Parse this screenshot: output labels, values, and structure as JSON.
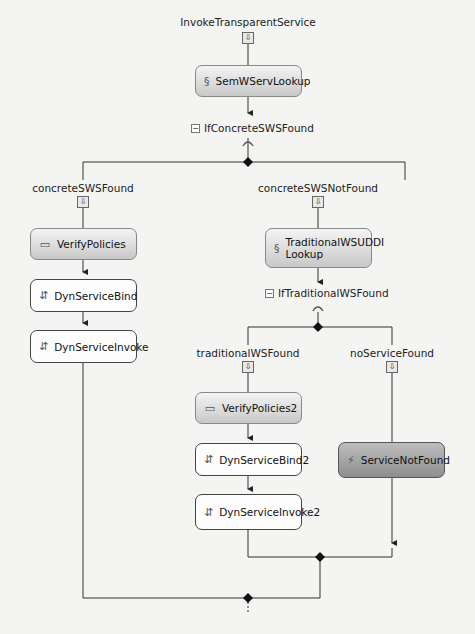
{
  "workflow": {
    "root_label": "InvokeTransparentService",
    "nodes": {
      "semwserv": {
        "label": "SemWServLookup",
        "icon": "script-icon"
      },
      "verify1": {
        "label": "VerifyPolicies",
        "icon": "policy-icon"
      },
      "bind1": {
        "label": "DynServiceBind",
        "icon": "invoke-icon"
      },
      "invoke1": {
        "label": "DynServiceInvoke",
        "icon": "invoke-icon"
      },
      "uddi": {
        "label_line1": "TraditionalWSUDDI",
        "label_line2": "Lookup",
        "icon": "script-icon"
      },
      "verify2": {
        "label": "VerifyPolicies2",
        "icon": "policy-icon"
      },
      "bind2": {
        "label": "DynServiceBind2",
        "icon": "invoke-icon"
      },
      "invoke2": {
        "label": "DynServiceInvoke2",
        "icon": "invoke-icon"
      },
      "notfound": {
        "label": "ServiceNotFound",
        "icon": "throw-icon"
      }
    },
    "conditions": {
      "if_concrete": {
        "label": "IfConcreteSWSFound",
        "collapse": "−"
      },
      "if_traditional": {
        "label": "IfTraditionalWSFound",
        "collapse": "−"
      }
    },
    "branches": {
      "concrete_found": "concreteSWSFound",
      "concrete_not_found": "concreteSWSNotFound",
      "traditional_found": "traditionalWSFound",
      "no_service": "noServiceFound"
    },
    "glyphs": {
      "sequence": "⇩",
      "script": "§",
      "policy": "▭",
      "invoke": "⇵",
      "throw": "⚡"
    }
  }
}
